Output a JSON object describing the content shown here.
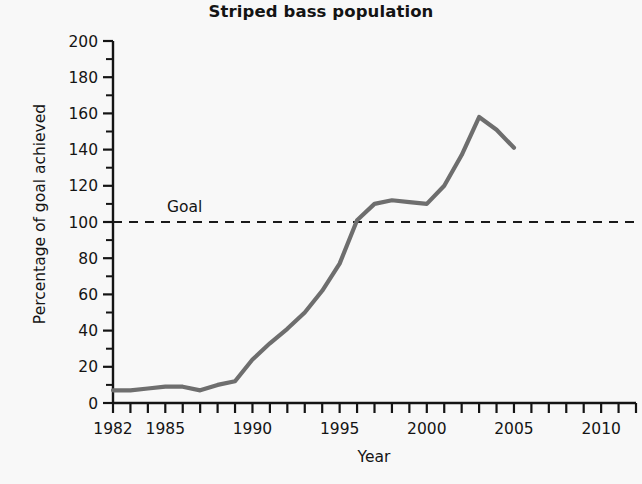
{
  "chart_data": {
    "type": "line",
    "title": "Striped bass population",
    "xlabel": "Year",
    "ylabel": "Percentage of goal achieved",
    "xlim": [
      1982,
      2012
    ],
    "ylim": [
      0,
      200
    ],
    "ytick_step": 20,
    "yminor_step": 10,
    "xtick_step": 1,
    "grid": false,
    "legend": null,
    "xticklabels": [
      "1982",
      "1985",
      "1990",
      "1995",
      "2000",
      "2005",
      "2010"
    ],
    "xticklabel_values": [
      1982,
      1985,
      1990,
      1995,
      2000,
      2005,
      2010
    ],
    "yticklabels": [
      "0",
      "20",
      "40",
      "60",
      "80",
      "100",
      "120",
      "140",
      "160",
      "180",
      "200"
    ],
    "yticklabel_values": [
      0,
      20,
      40,
      60,
      80,
      100,
      120,
      140,
      160,
      180,
      200
    ],
    "x": [
      1982,
      1983,
      1984,
      1985,
      1986,
      1987,
      1988,
      1989,
      1990,
      1991,
      1992,
      1993,
      1994,
      1995,
      1996,
      1997,
      1998,
      1999,
      2000,
      2001,
      2002,
      2003,
      2004,
      2005
    ],
    "values": [
      7,
      7,
      8,
      9,
      9,
      7,
      10,
      12,
      24,
      33,
      41,
      50,
      62,
      77,
      101,
      110,
      112,
      111,
      110,
      120,
      137,
      158,
      151,
      141
    ],
    "series": [
      {
        "name": "Striped bass population",
        "color": "#6e6e6e",
        "values": [
          7,
          7,
          8,
          9,
          9,
          7,
          10,
          12,
          24,
          33,
          41,
          50,
          62,
          77,
          101,
          110,
          112,
          111,
          110,
          120,
          137,
          158,
          151,
          141
        ]
      }
    ],
    "annotations": [
      {
        "name": "goal-line",
        "label": "Goal",
        "type": "hline",
        "y": 100,
        "style": "dashed",
        "color": "#1a1a1a"
      }
    ]
  },
  "colors": {
    "background": "#f8f8f8",
    "axis": "#141414",
    "line": "#6e6e6e",
    "goal": "#1a1a1a"
  }
}
